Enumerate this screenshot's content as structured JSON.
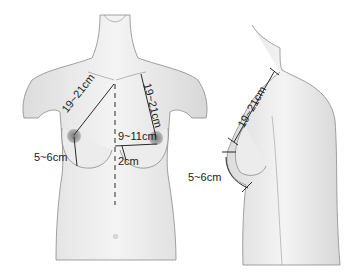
{
  "figure": {
    "front_view": {
      "labels": {
        "sternal_notch_to_nipple_left": "19~21cm",
        "sternal_notch_to_nipple_right": "19~21cm",
        "midline_to_nipple": "9~11cm",
        "nipple_to_fold": "5~6cm",
        "midline_offset": "2cm"
      }
    },
    "side_view": {
      "labels": {
        "sternal_notch_to_nipple": "19~21cm",
        "nipple_to_fold": "5~6cm"
      }
    },
    "colors": {
      "skin": "#ececec",
      "outline": "#7a7a7a",
      "areola": "#8e8e8e",
      "measure_line": "#2a2a2a"
    }
  }
}
